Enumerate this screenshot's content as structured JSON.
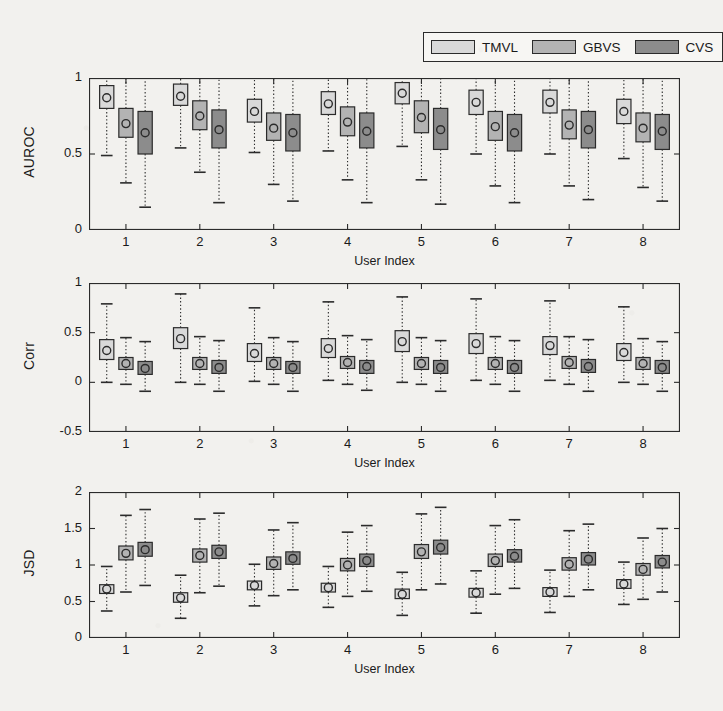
{
  "figure": {
    "background": "#f2f1ee",
    "axis_color": "#2b2b2b",
    "legend": {
      "position": "top-right",
      "entries": [
        {
          "label": "TMVL",
          "color": "#d9d9d9"
        },
        {
          "label": "GBVS",
          "color": "#b3b3b3"
        },
        {
          "label": "CVS",
          "color": "#8c8c8c"
        }
      ]
    }
  },
  "chart_data": [
    {
      "type": "box",
      "panel": "auroc",
      "title": "",
      "xlabel": "User Index",
      "ylabel": "AUROC",
      "categories": [
        "1",
        "2",
        "3",
        "4",
        "5",
        "6",
        "7",
        "8"
      ],
      "xlim": [
        0.5,
        8.5
      ],
      "ylim": [
        0,
        1
      ],
      "yticks": [
        0,
        0.5,
        1
      ],
      "ytick_labels": [
        "0",
        "0.5",
        "1"
      ],
      "grid": false,
      "legend_position": "top-right",
      "series": [
        {
          "name": "TMVL",
          "color": "#d9d9d9",
          "boxes": [
            {
              "whisker_low": 0.49,
              "q1": 0.8,
              "median": 0.87,
              "q3": 0.95,
              "whisker_high": 1.0
            },
            {
              "whisker_low": 0.54,
              "q1": 0.82,
              "median": 0.88,
              "q3": 0.96,
              "whisker_high": 1.0
            },
            {
              "whisker_low": 0.51,
              "q1": 0.71,
              "median": 0.78,
              "q3": 0.86,
              "whisker_high": 1.0
            },
            {
              "whisker_low": 0.52,
              "q1": 0.76,
              "median": 0.83,
              "q3": 0.91,
              "whisker_high": 1.0
            },
            {
              "whisker_low": 0.55,
              "q1": 0.83,
              "median": 0.9,
              "q3": 0.97,
              "whisker_high": 1.0
            },
            {
              "whisker_low": 0.5,
              "q1": 0.76,
              "median": 0.84,
              "q3": 0.92,
              "whisker_high": 1.0
            },
            {
              "whisker_low": 0.5,
              "q1": 0.77,
              "median": 0.84,
              "q3": 0.92,
              "whisker_high": 1.0
            },
            {
              "whisker_low": 0.47,
              "q1": 0.7,
              "median": 0.78,
              "q3": 0.86,
              "whisker_high": 1.0
            }
          ]
        },
        {
          "name": "GBVS",
          "color": "#b3b3b3",
          "boxes": [
            {
              "whisker_low": 0.31,
              "q1": 0.61,
              "median": 0.7,
              "q3": 0.8,
              "whisker_high": 1.0
            },
            {
              "whisker_low": 0.38,
              "q1": 0.66,
              "median": 0.75,
              "q3": 0.85,
              "whisker_high": 1.0
            },
            {
              "whisker_low": 0.3,
              "q1": 0.59,
              "median": 0.67,
              "q3": 0.77,
              "whisker_high": 1.0
            },
            {
              "whisker_low": 0.33,
              "q1": 0.62,
              "median": 0.71,
              "q3": 0.81,
              "whisker_high": 1.0
            },
            {
              "whisker_low": 0.33,
              "q1": 0.64,
              "median": 0.74,
              "q3": 0.85,
              "whisker_high": 1.0
            },
            {
              "whisker_low": 0.29,
              "q1": 0.59,
              "median": 0.68,
              "q3": 0.78,
              "whisker_high": 1.0
            },
            {
              "whisker_low": 0.29,
              "q1": 0.6,
              "median": 0.69,
              "q3": 0.79,
              "whisker_high": 1.0
            },
            {
              "whisker_low": 0.28,
              "q1": 0.58,
              "median": 0.67,
              "q3": 0.77,
              "whisker_high": 1.0
            }
          ]
        },
        {
          "name": "CVS",
          "color": "#8c8c8c",
          "boxes": [
            {
              "whisker_low": 0.15,
              "q1": 0.5,
              "median": 0.64,
              "q3": 0.78,
              "whisker_high": 1.0
            },
            {
              "whisker_low": 0.18,
              "q1": 0.54,
              "median": 0.66,
              "q3": 0.79,
              "whisker_high": 1.0
            },
            {
              "whisker_low": 0.19,
              "q1": 0.52,
              "median": 0.64,
              "q3": 0.76,
              "whisker_high": 1.0
            },
            {
              "whisker_low": 0.18,
              "q1": 0.54,
              "median": 0.65,
              "q3": 0.77,
              "whisker_high": 1.0
            },
            {
              "whisker_low": 0.17,
              "q1": 0.53,
              "median": 0.66,
              "q3": 0.8,
              "whisker_high": 1.0
            },
            {
              "whisker_low": 0.18,
              "q1": 0.52,
              "median": 0.64,
              "q3": 0.76,
              "whisker_high": 1.0
            },
            {
              "whisker_low": 0.2,
              "q1": 0.54,
              "median": 0.66,
              "q3": 0.78,
              "whisker_high": 1.0
            },
            {
              "whisker_low": 0.19,
              "q1": 0.53,
              "median": 0.65,
              "q3": 0.76,
              "whisker_high": 1.0
            }
          ]
        }
      ]
    },
    {
      "type": "box",
      "panel": "corr",
      "title": "",
      "xlabel": "User Index",
      "ylabel": "Corr",
      "categories": [
        "1",
        "2",
        "3",
        "4",
        "5",
        "6",
        "7",
        "8"
      ],
      "xlim": [
        0.5,
        8.5
      ],
      "ylim": [
        -0.5,
        1
      ],
      "yticks": [
        -0.5,
        0,
        0.5,
        1
      ],
      "ytick_labels": [
        "-0.5",
        "0",
        "0.5",
        "1"
      ],
      "grid": false,
      "legend_position": "none",
      "series": [
        {
          "name": "TMVL",
          "color": "#d9d9d9",
          "boxes": [
            {
              "whisker_low": 0.0,
              "q1": 0.23,
              "median": 0.32,
              "q3": 0.43,
              "whisker_high": 0.79
            },
            {
              "whisker_low": 0.0,
              "q1": 0.34,
              "median": 0.44,
              "q3": 0.55,
              "whisker_high": 0.89
            },
            {
              "whisker_low": 0.01,
              "q1": 0.21,
              "median": 0.29,
              "q3": 0.39,
              "whisker_high": 0.75
            },
            {
              "whisker_low": 0.02,
              "q1": 0.25,
              "median": 0.34,
              "q3": 0.44,
              "whisker_high": 0.81
            },
            {
              "whisker_low": 0.0,
              "q1": 0.31,
              "median": 0.41,
              "q3": 0.52,
              "whisker_high": 0.86
            },
            {
              "whisker_low": 0.02,
              "q1": 0.29,
              "median": 0.39,
              "q3": 0.49,
              "whisker_high": 0.84
            },
            {
              "whisker_low": 0.02,
              "q1": 0.28,
              "median": 0.37,
              "q3": 0.46,
              "whisker_high": 0.82
            },
            {
              "whisker_low": 0.0,
              "q1": 0.22,
              "median": 0.3,
              "q3": 0.39,
              "whisker_high": 0.76
            }
          ]
        },
        {
          "name": "GBVS",
          "color": "#b3b3b3",
          "boxes": [
            {
              "whisker_low": -0.02,
              "q1": 0.13,
              "median": 0.19,
              "q3": 0.25,
              "whisker_high": 0.45
            },
            {
              "whisker_low": -0.02,
              "q1": 0.13,
              "median": 0.19,
              "q3": 0.25,
              "whisker_high": 0.46
            },
            {
              "whisker_low": -0.02,
              "q1": 0.13,
              "median": 0.19,
              "q3": 0.25,
              "whisker_high": 0.45
            },
            {
              "whisker_low": -0.02,
              "q1": 0.14,
              "median": 0.2,
              "q3": 0.26,
              "whisker_high": 0.47
            },
            {
              "whisker_low": -0.02,
              "q1": 0.13,
              "median": 0.19,
              "q3": 0.25,
              "whisker_high": 0.45
            },
            {
              "whisker_low": -0.02,
              "q1": 0.13,
              "median": 0.19,
              "q3": 0.25,
              "whisker_high": 0.46
            },
            {
              "whisker_low": -0.02,
              "q1": 0.14,
              "median": 0.2,
              "q3": 0.26,
              "whisker_high": 0.46
            },
            {
              "whisker_low": -0.02,
              "q1": 0.13,
              "median": 0.19,
              "q3": 0.25,
              "whisker_high": 0.44
            }
          ]
        },
        {
          "name": "CVS",
          "color": "#8c8c8c",
          "boxes": [
            {
              "whisker_low": -0.09,
              "q1": 0.08,
              "median": 0.14,
              "q3": 0.21,
              "whisker_high": 0.41
            },
            {
              "whisker_low": -0.09,
              "q1": 0.09,
              "median": 0.15,
              "q3": 0.22,
              "whisker_high": 0.42
            },
            {
              "whisker_low": -0.09,
              "q1": 0.09,
              "median": 0.15,
              "q3": 0.21,
              "whisker_high": 0.41
            },
            {
              "whisker_low": -0.08,
              "q1": 0.09,
              "median": 0.16,
              "q3": 0.22,
              "whisker_high": 0.43
            },
            {
              "whisker_low": -0.09,
              "q1": 0.09,
              "median": 0.15,
              "q3": 0.22,
              "whisker_high": 0.42
            },
            {
              "whisker_low": -0.09,
              "q1": 0.09,
              "median": 0.15,
              "q3": 0.22,
              "whisker_high": 0.42
            },
            {
              "whisker_low": -0.09,
              "q1": 0.1,
              "median": 0.16,
              "q3": 0.23,
              "whisker_high": 0.43
            },
            {
              "whisker_low": -0.09,
              "q1": 0.09,
              "median": 0.15,
              "q3": 0.22,
              "whisker_high": 0.41
            }
          ]
        }
      ]
    },
    {
      "type": "box",
      "panel": "jsd",
      "title": "",
      "xlabel": "User Index",
      "ylabel": "JSD",
      "categories": [
        "1",
        "2",
        "3",
        "4",
        "5",
        "6",
        "7",
        "8"
      ],
      "xlim": [
        0.5,
        8.5
      ],
      "ylim": [
        0,
        2
      ],
      "yticks": [
        0,
        0.5,
        1,
        1.5,
        2
      ],
      "ytick_labels": [
        "0",
        "0.5",
        "1",
        "1.5",
        "2"
      ],
      "grid": false,
      "legend_position": "none",
      "series": [
        {
          "name": "TMVL",
          "color": "#d9d9d9",
          "boxes": [
            {
              "whisker_low": 0.37,
              "q1": 0.61,
              "median": 0.67,
              "q3": 0.73,
              "whisker_high": 0.98
            },
            {
              "whisker_low": 0.27,
              "q1": 0.49,
              "median": 0.55,
              "q3": 0.62,
              "whisker_high": 0.86
            },
            {
              "whisker_low": 0.44,
              "q1": 0.66,
              "median": 0.72,
              "q3": 0.78,
              "whisker_high": 1.01
            },
            {
              "whisker_low": 0.42,
              "q1": 0.63,
              "median": 0.69,
              "q3": 0.75,
              "whisker_high": 0.98
            },
            {
              "whisker_low": 0.31,
              "q1": 0.54,
              "median": 0.6,
              "q3": 0.67,
              "whisker_high": 0.9
            },
            {
              "whisker_low": 0.34,
              "q1": 0.56,
              "median": 0.62,
              "q3": 0.68,
              "whisker_high": 0.92
            },
            {
              "whisker_low": 0.35,
              "q1": 0.57,
              "median": 0.63,
              "q3": 0.69,
              "whisker_high": 0.93
            },
            {
              "whisker_low": 0.46,
              "q1": 0.68,
              "median": 0.74,
              "q3": 0.8,
              "whisker_high": 1.04
            }
          ]
        },
        {
          "name": "GBVS",
          "color": "#b3b3b3",
          "boxes": [
            {
              "whisker_low": 0.63,
              "q1": 1.07,
              "median": 1.16,
              "q3": 1.26,
              "whisker_high": 1.68
            },
            {
              "whisker_low": 0.62,
              "q1": 1.04,
              "median": 1.13,
              "q3": 1.22,
              "whisker_high": 1.63
            },
            {
              "whisker_low": 0.58,
              "q1": 0.94,
              "median": 1.02,
              "q3": 1.11,
              "whisker_high": 1.48
            },
            {
              "whisker_low": 0.57,
              "q1": 0.92,
              "median": 1.0,
              "q3": 1.09,
              "whisker_high": 1.45
            },
            {
              "whisker_low": 0.66,
              "q1": 1.09,
              "median": 1.18,
              "q3": 1.28,
              "whisker_high": 1.7
            },
            {
              "whisker_low": 0.6,
              "q1": 0.98,
              "median": 1.06,
              "q3": 1.15,
              "whisker_high": 1.54
            },
            {
              "whisker_low": 0.57,
              "q1": 0.93,
              "median": 1.01,
              "q3": 1.1,
              "whisker_high": 1.47
            },
            {
              "whisker_low": 0.53,
              "q1": 0.86,
              "median": 0.94,
              "q3": 1.02,
              "whisker_high": 1.37
            }
          ]
        },
        {
          "name": "CVS",
          "color": "#8c8c8c",
          "boxes": [
            {
              "whisker_low": 0.72,
              "q1": 1.12,
              "median": 1.21,
              "q3": 1.31,
              "whisker_high": 1.76
            },
            {
              "whisker_low": 0.71,
              "q1": 1.09,
              "median": 1.18,
              "q3": 1.27,
              "whisker_high": 1.71
            },
            {
              "whisker_low": 0.66,
              "q1": 1.01,
              "median": 1.09,
              "q3": 1.18,
              "whisker_high": 1.58
            },
            {
              "whisker_low": 0.64,
              "q1": 0.98,
              "median": 1.06,
              "q3": 1.15,
              "whisker_high": 1.54
            },
            {
              "whisker_low": 0.74,
              "q1": 1.15,
              "median": 1.24,
              "q3": 1.34,
              "whisker_high": 1.79
            },
            {
              "whisker_low": 0.68,
              "q1": 1.04,
              "median": 1.12,
              "q3": 1.21,
              "whisker_high": 1.62
            },
            {
              "whisker_low": 0.66,
              "q1": 1.0,
              "median": 1.08,
              "q3": 1.17,
              "whisker_high": 1.56
            },
            {
              "whisker_low": 0.63,
              "q1": 0.96,
              "median": 1.04,
              "q3": 1.13,
              "whisker_high": 1.5
            }
          ]
        }
      ]
    }
  ]
}
